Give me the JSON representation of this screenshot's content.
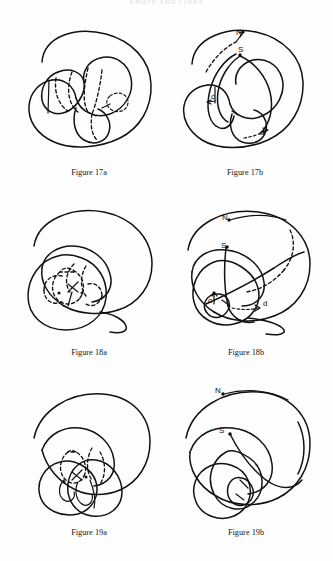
{
  "page": {
    "running_head": "KNOTS AND LINKS",
    "background_color": "#fefefe",
    "ink_color": "#121212",
    "width": 333,
    "height": 561
  },
  "figures": [
    {
      "id": "figure-17a",
      "caption": "Figure 17a",
      "labels": []
    },
    {
      "id": "figure-17b",
      "caption": "Figure 17b",
      "labels": [
        {
          "text": "N",
          "x": 66,
          "y": 13
        },
        {
          "text": "S",
          "x": 68,
          "y": 30
        },
        {
          "text": "c",
          "x": 41,
          "y": 77
        },
        {
          "text": "d",
          "x": 90,
          "y": 113
        }
      ]
    },
    {
      "id": "figure-18a",
      "caption": "Figure 18a",
      "labels": []
    },
    {
      "id": "figure-18b",
      "caption": "Figure 18b",
      "labels": [
        {
          "text": "N",
          "x": 52,
          "y": 18
        },
        {
          "text": "S",
          "x": 51,
          "y": 46
        },
        {
          "text": "c",
          "x": 38,
          "y": 101
        },
        {
          "text": "d",
          "x": 93,
          "y": 104
        }
      ]
    },
    {
      "id": "figure-19a",
      "caption": "Figure 19a",
      "labels": []
    },
    {
      "id": "figure-19b",
      "caption": "Figure 19b",
      "labels": [
        {
          "text": "N",
          "x": 45,
          "y": 11
        },
        {
          "text": "S",
          "x": 49,
          "y": 51
        }
      ]
    }
  ]
}
